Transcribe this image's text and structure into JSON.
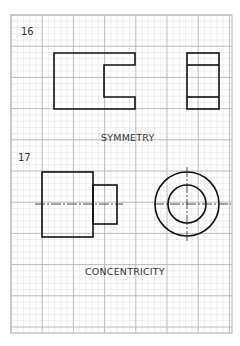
{
  "sheet": {
    "paper": "graph paper",
    "grid_minor_per_major": 5,
    "colors": {
      "background": "#ffffff",
      "grid_major": "#b4b4b4",
      "grid_minor": "#e2e2e2",
      "ink": "#111111",
      "text": "#333333"
    }
  },
  "exercises": [
    {
      "number": "16",
      "caption": "SYMMETRY",
      "views": [
        "front view with centered slot (C-shape)",
        "side view with two horizontal lines"
      ]
    },
    {
      "number": "17",
      "caption": "CONCENTRICITY",
      "views": [
        "stepped cylinder side view with centerline",
        "end view with two concentric circles and crosshair centerlines"
      ]
    }
  ]
}
